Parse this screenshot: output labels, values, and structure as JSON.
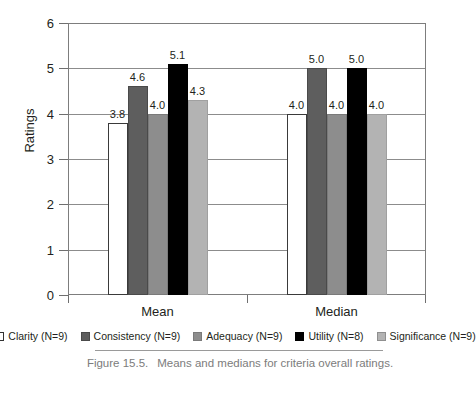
{
  "chart_data": {
    "type": "bar",
    "title": "",
    "xlabel": "",
    "ylabel": "Ratings",
    "ylim": [
      0,
      6
    ],
    "yticks": [
      0,
      1,
      2,
      3,
      4,
      5,
      6
    ],
    "ytick_labels": [
      "0",
      "1",
      "2",
      "3",
      "4",
      "5",
      "6"
    ],
    "grid": true,
    "grid_axis": "y",
    "legend_position": "bottom",
    "categories": [
      "Mean",
      "Median"
    ],
    "series": [
      {
        "name": "Clarity (N=9)",
        "key": "clarity",
        "color": "#ffffff",
        "values": [
          3.8,
          4.0
        ],
        "labels": [
          "3.8",
          "4.0"
        ]
      },
      {
        "name": "Consistency (N=9)",
        "key": "consistency",
        "color": "#5e5e5e",
        "values": [
          4.6,
          5.0
        ],
        "labels": [
          "4.6",
          "5.0"
        ]
      },
      {
        "name": "Adequacy (N=9)",
        "key": "adequacy",
        "color": "#8d8d8d",
        "values": [
          4.0,
          4.0
        ],
        "labels": [
          "4.0",
          "4.0"
        ]
      },
      {
        "name": "Utility (N=8)",
        "key": "utility",
        "color": "#000000",
        "values": [
          5.1,
          5.0
        ],
        "labels": [
          "5.1",
          "5.0"
        ]
      },
      {
        "name": "Significance (N=9)",
        "key": "significance",
        "color": "#b3b3b3",
        "values": [
          4.3,
          4.0
        ],
        "labels": [
          "4.3",
          "4.0"
        ]
      }
    ]
  },
  "caption": {
    "number": "Figure 15.5.",
    "text": "Means and medians for criteria overall ratings."
  }
}
